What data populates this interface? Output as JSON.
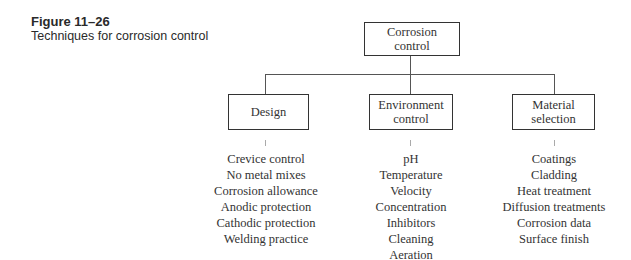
{
  "caption": {
    "figure_label": "Figure 11–26",
    "description": "Techniques for corrosion control"
  },
  "root": {
    "label_line1": "Corrosion",
    "label_line2": "control"
  },
  "branches": [
    {
      "label_line1": "Design",
      "label_line2": "",
      "items": [
        "Crevice control",
        "No metal mixes",
        "Corrosion allowance",
        "Anodic protection",
        "Cathodic protection",
        "Welding practice"
      ]
    },
    {
      "label_line1": "Environment",
      "label_line2": "control",
      "items": [
        "pH",
        "Temperature",
        "Velocity",
        "Concentration",
        "Inhibitors",
        "Cleaning",
        "Aeration"
      ]
    },
    {
      "label_line1": "Material",
      "label_line2": "selection",
      "items": [
        "Coatings",
        "Cladding",
        "Heat treatment",
        "Diffusion treatments",
        "Corrosion data",
        "Surface finish"
      ]
    }
  ]
}
